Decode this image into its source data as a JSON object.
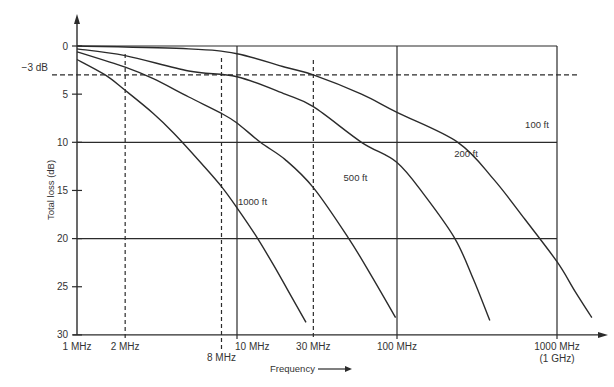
{
  "chart_data": {
    "type": "line",
    "title": "",
    "xlabel": "Frequency",
    "ylabel": "Total loss (dB)",
    "x_scale": "log",
    "x_unit": "MHz",
    "xlim": [
      1,
      2000
    ],
    "ylim": [
      0,
      30
    ],
    "y_inverted": true,
    "y_ticks": [
      0,
      5,
      10,
      15,
      20,
      25,
      30
    ],
    "y_tick_labels": [
      "0",
      "5",
      "10",
      "15",
      "20",
      "25",
      "30"
    ],
    "x_ticks": [
      {
        "value": 1,
        "label": "1 MHz",
        "line": "none"
      },
      {
        "value": 2,
        "label": "2 MHz",
        "line": "dashed"
      },
      {
        "value": 8,
        "label": "8 MHz",
        "line": "dashed"
      },
      {
        "value": 10,
        "label": "10 MHz",
        "line": "solid"
      },
      {
        "value": 30,
        "label": "30 MHz",
        "line": "dashed"
      },
      {
        "value": 100,
        "label": "100 MHz",
        "line": "solid"
      },
      {
        "value": 1000,
        "label": "1000 MHz",
        "sublabel": "(1 GHz)",
        "line": "solid"
      }
    ],
    "h_grid_solid": [
      0,
      10,
      20
    ],
    "reference_line": {
      "value": 3,
      "label": "−3 dB",
      "style": "dashed"
    },
    "grid": true,
    "legend": "inline curve labels",
    "series": [
      {
        "name": "1000 ft",
        "x": [
          1,
          1.5,
          2,
          3,
          4,
          6,
          8,
          10,
          13,
          17,
          21,
          27
        ],
        "y": [
          1.4,
          3.0,
          4.6,
          7.0,
          9.0,
          12.2,
          14.6,
          16.8,
          19.6,
          22.8,
          25.5,
          28.7
        ]
      },
      {
        "name": "500 ft",
        "x": [
          1,
          2,
          3,
          5,
          8,
          10,
          14,
          20,
          30,
          50,
          70,
          98
        ],
        "y": [
          0.6,
          2.2,
          3.4,
          5.3,
          7.0,
          8.0,
          10.0,
          11.8,
          14.7,
          20.0,
          24.0,
          28.2
        ]
      },
      {
        "name": "200 ft",
        "x": [
          1,
          2,
          5,
          10,
          20,
          30,
          60,
          100,
          150,
          230,
          300,
          380
        ],
        "y": [
          0.3,
          1.0,
          2.6,
          3.2,
          5.0,
          6.3,
          10.0,
          12.1,
          15.6,
          20.0,
          24.2,
          28.5
        ]
      },
      {
        "name": "100 ft",
        "x": [
          1,
          5,
          10,
          20,
          30,
          60,
          100,
          240,
          400,
          630,
          1000,
          1300,
          1650
        ],
        "y": [
          0.0,
          0.3,
          0.8,
          2.2,
          3.0,
          5.0,
          6.9,
          10.0,
          13.8,
          18.0,
          22.4,
          25.5,
          28.2
        ]
      }
    ],
    "curve_labels": [
      {
        "series": "1000 ft",
        "x_mhz": 12.5,
        "y_db": 16.5
      },
      {
        "series": "500 ft",
        "x_mhz": 55,
        "y_db": 14.0
      },
      {
        "series": "200 ft",
        "x_mhz": 270,
        "y_db": 11.5
      },
      {
        "series": "100 ft",
        "x_mhz": 750,
        "y_db": 8.5
      }
    ]
  },
  "labels": {
    "y_axis_title": "Total loss (dB)",
    "x_axis_title": "Frequency",
    "ref_label": "−3 dB"
  },
  "colors": {
    "line": "#2b2b2b",
    "text": "#333333",
    "background": "#ffffff"
  }
}
